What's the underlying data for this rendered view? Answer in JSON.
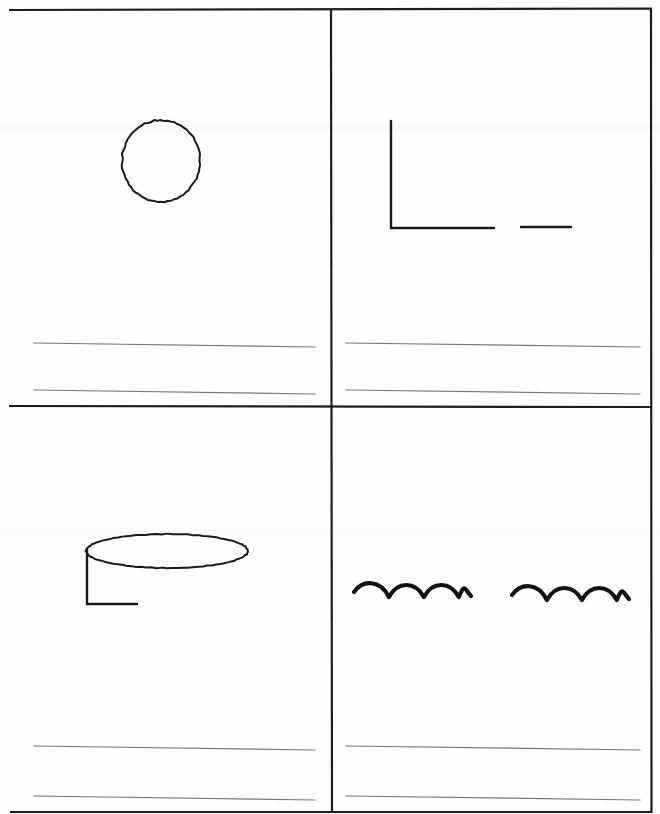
{
  "document": {
    "kind": "scanned-worksheet-page",
    "title": "Four-panel drawing worksheet",
    "page_width": 660,
    "page_height": 814,
    "background_color": "#fefefe",
    "ink_color": "#1a1a1a",
    "rule_line_color": "#6e6e6e",
    "border_color": "#1d1d1d",
    "panel_count": 4
  },
  "border": {
    "name": "page-border",
    "left": 9,
    "top": 10,
    "right": 651,
    "bottom": 812,
    "stroke_width": 2.2,
    "color": "#1d1d1d"
  },
  "dividers": {
    "vertical": {
      "name": "vertical-divider",
      "x": 331,
      "y1": 10,
      "y2": 812,
      "stroke_width": 2.2,
      "color": "#1d1d1d"
    },
    "horizontal": {
      "name": "horizontal-divider",
      "y": 406,
      "x1": 9,
      "x2": 651,
      "stroke_width": 2.2,
      "color": "#1d1d1d"
    }
  },
  "scan_artifacts": [
    {
      "name": "scan-band-upper",
      "y": 124,
      "height": 8,
      "color": "#fafafa"
    },
    {
      "name": "scan-band-lower",
      "y": 528,
      "height": 8,
      "color": "#fcfcfc"
    }
  ],
  "panels": [
    {
      "id": "panel-top-left",
      "position": "top-left",
      "drawing": {
        "name": "circle-doodle",
        "shape": "circle",
        "description": "hand-drawn open circle",
        "center_x": 161,
        "center_y": 161,
        "radius_x": 39,
        "radius_y": 41,
        "stroke_width": 2.0,
        "color": "#1a1a1a"
      },
      "rule_lines": [
        {
          "name": "rule-line-1",
          "x1": 34,
          "y1": 343,
          "x2": 315,
          "y2": 347
        },
        {
          "name": "rule-line-2",
          "x1": 34,
          "y1": 390,
          "x2": 315,
          "y2": 394
        }
      ]
    },
    {
      "id": "panel-top-right",
      "position": "top-right",
      "drawing": {
        "name": "corner-line-doodle",
        "shape": "l-corner-with-dash",
        "description": "vertical stroke meeting a horizontal stroke, plus a detached horizontal dash to the right",
        "stroke_width": 2.4,
        "color": "#1a1a1a",
        "segments": [
          {
            "name": "vertical-stroke",
            "x1": 391,
            "y1": 121,
            "x2": 391,
            "y2": 228
          },
          {
            "name": "horizontal-stroke",
            "x1": 391,
            "y1": 228,
            "x2": 494,
            "y2": 228
          },
          {
            "name": "detached-dash",
            "x1": 521,
            "y1": 227,
            "x2": 571,
            "y2": 227
          }
        ]
      },
      "rule_lines": [
        {
          "name": "rule-line-1",
          "x1": 346,
          "y1": 343,
          "x2": 640,
          "y2": 347
        },
        {
          "name": "rule-line-2",
          "x1": 346,
          "y1": 390,
          "x2": 640,
          "y2": 394
        }
      ]
    },
    {
      "id": "panel-bottom-left",
      "position": "bottom-left",
      "drawing": {
        "name": "cylinder-doodle",
        "shape": "ellipse-with-corner",
        "description": "flat ellipse (cylinder top) with an L-shaped corner stroke below its left edge",
        "stroke_width": 2.0,
        "color": "#1a1a1a",
        "ellipse": {
          "name": "ellipse-top",
          "center_x": 167,
          "center_y": 551,
          "radius_x": 81,
          "radius_y": 17
        },
        "segments": [
          {
            "name": "vertical-stroke",
            "x1": 87,
            "y1": 549,
            "x2": 87,
            "y2": 604
          },
          {
            "name": "horizontal-stroke",
            "x1": 87,
            "y1": 604,
            "x2": 137,
            "y2": 604
          }
        ]
      },
      "rule_lines": [
        {
          "name": "rule-line-1",
          "x1": 34,
          "y1": 746,
          "x2": 315,
          "y2": 750
        },
        {
          "name": "rule-line-2",
          "x1": 34,
          "y1": 796,
          "x2": 315,
          "y2": 800
        }
      ]
    },
    {
      "id": "panel-bottom-right",
      "position": "bottom-right",
      "drawing": {
        "name": "wavy-lines-doodle",
        "shape": "two-wavy-lines",
        "description": "two separate horizontal squiggles, each with three humps",
        "stroke_width": 4.2,
        "color": "#111111",
        "waves": [
          {
            "name": "wave-left",
            "x_start": 354,
            "x_end": 471,
            "baseline_y": 592,
            "amplitude": 11,
            "humps": 3
          },
          {
            "name": "wave-right",
            "x_start": 512,
            "x_end": 629,
            "baseline_y": 595,
            "amplitude": 11,
            "humps": 3
          }
        ]
      },
      "rule_lines": [
        {
          "name": "rule-line-1",
          "x1": 346,
          "y1": 746,
          "x2": 640,
          "y2": 750
        },
        {
          "name": "rule-line-2",
          "x1": 346,
          "y1": 796,
          "x2": 640,
          "y2": 800
        }
      ]
    }
  ]
}
